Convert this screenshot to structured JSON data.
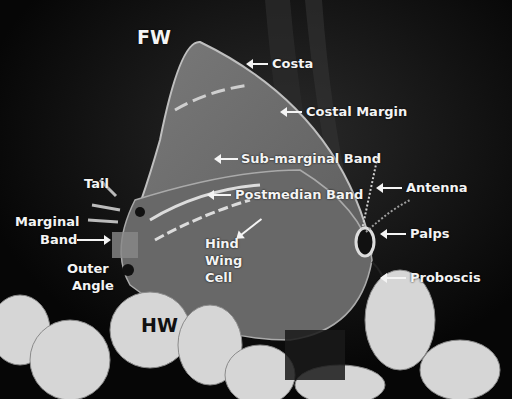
{
  "figure": {
    "colors": {
      "background": "#0a0a0a",
      "wing": "#6e6e6e",
      "label_text": "#f4f4f4",
      "hw_label_text": "#111111",
      "flowers": "#d8d8d8"
    }
  },
  "labels": {
    "fw": "FW",
    "hw": "HW",
    "costa": "Costa",
    "costal_margin": "Costal Margin",
    "sub_marginal_band": "Sub-marginal Band",
    "postmedian_band": "Postmedian Band",
    "antenna": "Antenna",
    "tail": "Tail",
    "marginal_band_line1": "Marginal",
    "marginal_band_line2": "Band",
    "palps": "Palps",
    "hind_wing_cell_line1": "Hind",
    "hind_wing_cell_line2": "Wing",
    "hind_wing_cell_line3": "Cell",
    "outer_angle_line1": "Outer",
    "outer_angle_line2": "Angle",
    "proboscis": "Proboscis"
  }
}
